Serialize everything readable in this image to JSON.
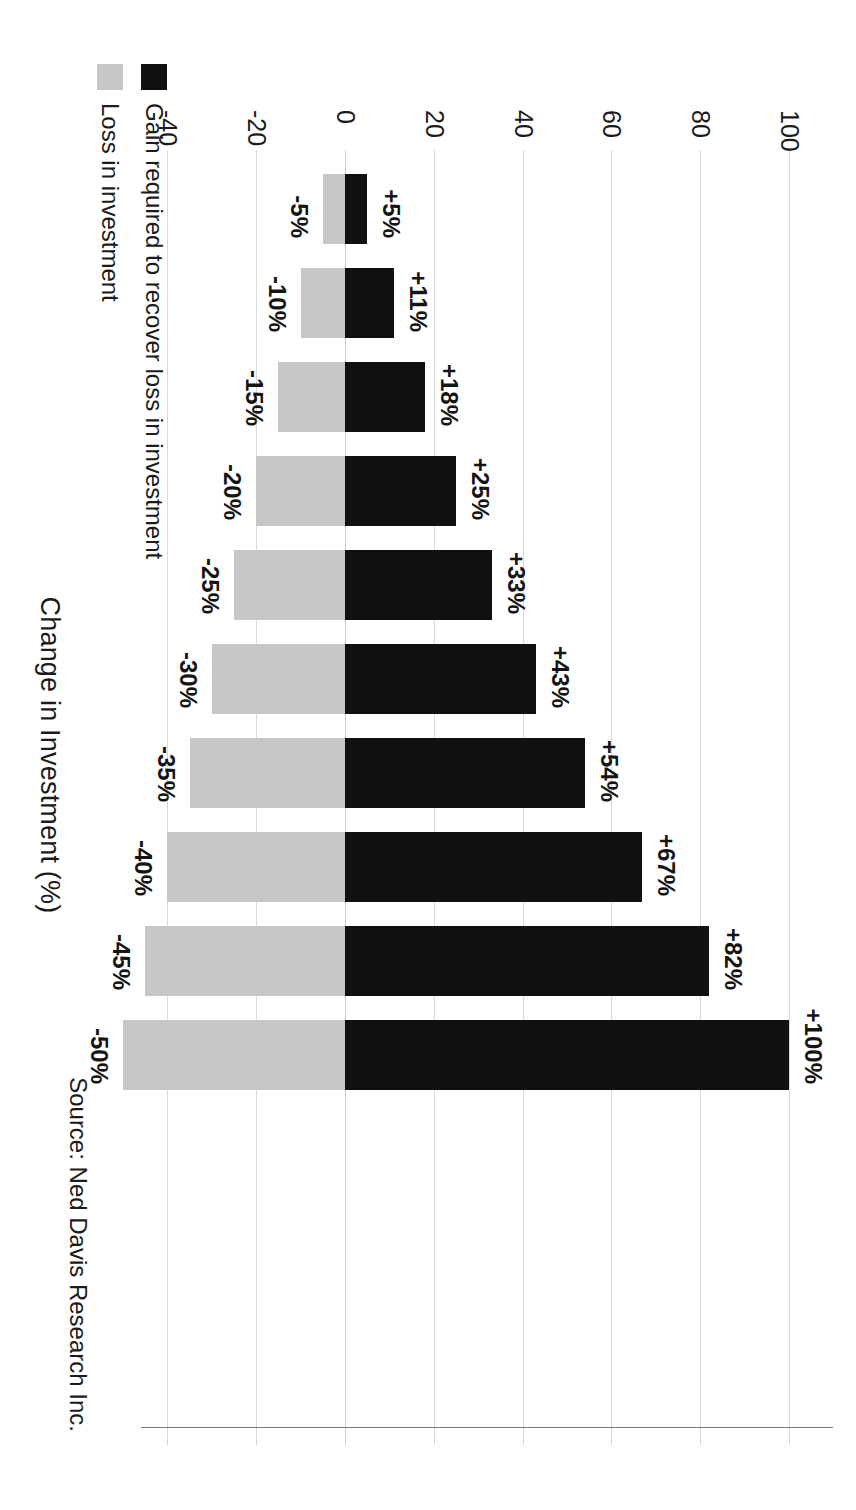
{
  "chart": {
    "title": "Change in Investment (%)",
    "source": "Source: Ned Davis Research Inc.",
    "legend": [
      {
        "key": "loss",
        "label": "Loss in investment",
        "color": "#c6c6c6",
        "swatch": "loss-swatch"
      },
      {
        "key": "gain",
        "label": "Gain required to recover loss in investment",
        "color": "#111111",
        "swatch": "gain-swatch"
      }
    ]
  },
  "chart_data": {
    "type": "bar",
    "orientation": "horizontal-pairs",
    "title": "Change in Investment (%)",
    "xlabel": "Change in Investment (%)",
    "ylabel": "",
    "xlim": [
      -50,
      110
    ],
    "grid": true,
    "legend_position": "top-left",
    "ticks": [
      -40,
      -20,
      0,
      20,
      40,
      60,
      80,
      100
    ],
    "tick_labels": [
      "-40",
      "-20",
      "0",
      "20",
      "40",
      "60",
      "80",
      "100"
    ],
    "categories": [
      "-5%",
      "-10%",
      "-15%",
      "-20%",
      "-25%",
      "-30%",
      "-35%",
      "-40%",
      "-45%",
      "-50%"
    ],
    "series": [
      {
        "name": "Loss in investment",
        "color": "#c6c6c6",
        "values": [
          -5,
          -10,
          -15,
          -20,
          -25,
          -30,
          -35,
          -40,
          -45,
          -50
        ],
        "labels": [
          "-5%",
          "-10%",
          "-15%",
          "-20%",
          "-25%",
          "-30%",
          "-35%",
          "-40%",
          "-45%",
          "-50%"
        ]
      },
      {
        "name": "Gain required to recover loss in investment",
        "color": "#111111",
        "values": [
          5,
          11,
          18,
          25,
          33,
          43,
          54,
          67,
          82,
          100
        ],
        "labels": [
          "+5%",
          "+11%",
          "+18%",
          "+25%",
          "+33%",
          "+43%",
          "+54%",
          "+67%",
          "+82%",
          "+100%"
        ]
      }
    ],
    "source": "Source: Ned Davis Research Inc."
  }
}
